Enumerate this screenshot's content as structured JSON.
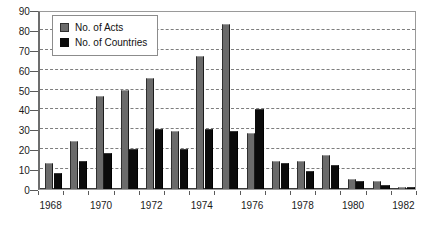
{
  "chart_data": {
    "type": "bar",
    "title": "",
    "xlabel": "",
    "ylabel": "",
    "ylim": [
      0,
      90
    ],
    "y_ticks": [
      0,
      10,
      20,
      30,
      40,
      50,
      60,
      70,
      80,
      90
    ],
    "grid": true,
    "legend_position": "top-left",
    "categories": [
      "1968",
      "1969",
      "1970",
      "1971",
      "1972",
      "1973",
      "1974",
      "1975",
      "1976",
      "1977",
      "1978",
      "1979",
      "1980",
      "1981",
      "1982"
    ],
    "x_tick_labels": [
      "1968",
      "1970",
      "1972",
      "1974",
      "1976",
      "1978",
      "1980",
      "1982"
    ],
    "series": [
      {
        "name": "No. of Acts",
        "color": "#6b6b6b",
        "values": [
          13,
          24,
          47,
          50,
          56,
          29,
          67,
          83,
          28,
          14,
          14,
          17,
          5,
          4,
          1
        ]
      },
      {
        "name": "No. of Countries",
        "color": "#0b0b0b",
        "values": [
          8,
          14,
          18,
          20,
          30,
          20,
          30,
          29,
          40,
          13,
          9,
          12,
          4,
          2,
          1
        ]
      }
    ]
  },
  "legend": {
    "items": [
      {
        "label": "No. of Acts",
        "swatch": "acts"
      },
      {
        "label": "No. of Countries",
        "swatch": "countries"
      }
    ]
  }
}
